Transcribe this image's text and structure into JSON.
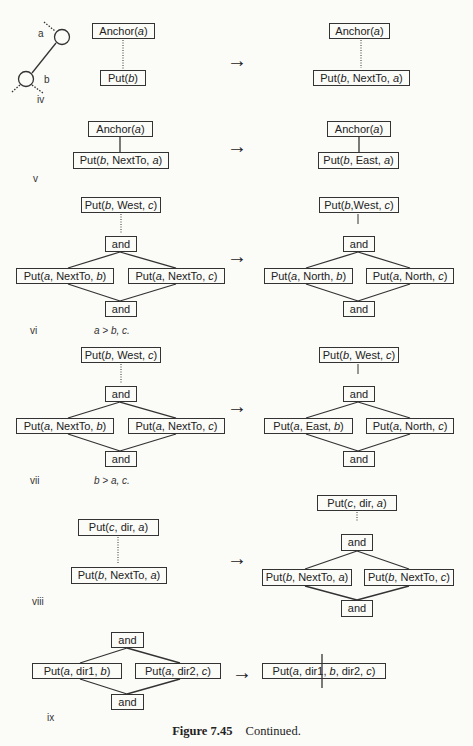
{
  "figure": {
    "caption_number": "Figure 7.45",
    "caption_text": "Continued."
  },
  "arrow_glyph": "→",
  "panels": {
    "iv": {
      "label": "iv",
      "graph_labels": {
        "node_a": "a",
        "node_b": "b"
      },
      "before": {
        "top": "Anchor(a)",
        "bottom": "Put(b)"
      },
      "after": {
        "top": "Anchor(a)",
        "bottom": "Put(b, NextTo, a)"
      }
    },
    "v": {
      "label": "v",
      "before": {
        "top": "Anchor(a)",
        "bottom": "Put(b, NextTo, a)"
      },
      "after": {
        "top": "Anchor(a)",
        "bottom": "Put(b, East, a)"
      }
    },
    "vi": {
      "label": "vi",
      "condition": "a > b, c.",
      "before": {
        "top": "Put(b, West, c)",
        "and_top": "and",
        "left": "Put(a, NextTo, b)",
        "right": "Put(a, NextTo, c)",
        "and_bottom": "and"
      },
      "after": {
        "top": "Put(b,West, c)",
        "and_top": "and",
        "left": "Put(a, North, b)",
        "right": "Put(a, North, c)",
        "and_bottom": "and"
      }
    },
    "vii": {
      "label": "vii",
      "condition": "b > a, c.",
      "before": {
        "top": "Put(b, West, c)",
        "and_top": "and",
        "left": "Put(a, NextTo, b)",
        "right": "Put(a, NextTo, c)",
        "and_bottom": "and"
      },
      "after": {
        "top": "Put(b, West, c)",
        "and_top": "and",
        "left": "Put(a, East, b)",
        "right": "Put(a, North, c)",
        "and_bottom": "and"
      }
    },
    "viii": {
      "label": "viii",
      "before": {
        "top": "Put(c, dir, a)",
        "bottom": "Put(b, NextTo, a)"
      },
      "after": {
        "top": "Put(c, dir, a)",
        "and_top": "and",
        "left": "Put(b, NextTo, a)",
        "right": "Put(b, NextTo, c)",
        "and_bottom": "and"
      }
    },
    "ix": {
      "label": "ix",
      "before": {
        "and_top": "and",
        "left": "Put(a, dir1, b)",
        "right": "Put(a, dir2, c)",
        "and_bottom": "and"
      },
      "after": {
        "merged": "Put(a, dir1, b, dir2, c)"
      }
    }
  }
}
